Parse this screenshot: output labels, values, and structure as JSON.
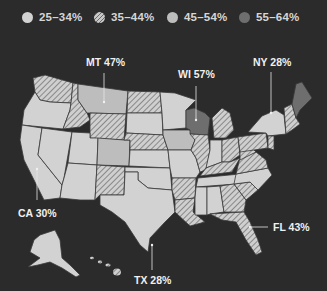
{
  "legend": [
    {
      "label": "25–34%",
      "style": "solid-light",
      "color": "#d0d0d0"
    },
    {
      "label": "35–44%",
      "style": "hatched",
      "color": "#c4c4c4"
    },
    {
      "label": "45–54%",
      "style": "solid-mid",
      "color": "#b8b8b8"
    },
    {
      "label": "55–64%",
      "style": "solid-dark",
      "color": "#6e6e6e"
    }
  ],
  "callouts": {
    "mt": "MT 47%",
    "wi": "WI 57%",
    "ny": "NY 28%",
    "ca": "CA 30%",
    "tx": "TX 28%",
    "fl": "FL 43%"
  },
  "colors": {
    "background": "#2b2b2b",
    "light": "#d2d2d2",
    "mid": "#bdbdbd",
    "dark": "#6e6e6e",
    "border": "#3a3a3a"
  }
}
